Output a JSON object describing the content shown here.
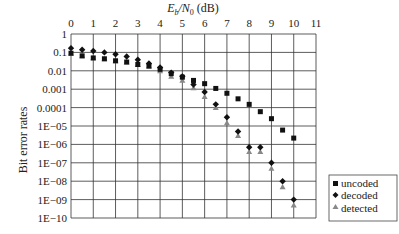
{
  "chart_data": {
    "type": "scatter",
    "title": "",
    "xlabel": "Eb/N0 (dB)",
    "ylabel": "Bit error rates",
    "x_scale": "linear",
    "y_scale": "log",
    "xlim": [
      0,
      11
    ],
    "ylim": [
      1e-10,
      1
    ],
    "xticks": [
      "0",
      "1",
      "2",
      "3",
      "4",
      "5",
      "6",
      "7",
      "8",
      "9",
      "10",
      "11"
    ],
    "yticks": [
      "1",
      "0.1",
      "0.01",
      "0.001",
      "0.0001",
      "1E−05",
      "1E−06",
      "1E−07",
      "1E−08",
      "1E−09",
      "1E−10"
    ],
    "grid": true,
    "legend_position": "right-bottom",
    "x": [
      0,
      0.5,
      1,
      1.5,
      2,
      2.5,
      3,
      3.5,
      4,
      4.5,
      5,
      5.5,
      6,
      6.5,
      7,
      7.5,
      8,
      8.5,
      9,
      9.5,
      10
    ],
    "series": [
      {
        "name": "uncoded",
        "marker": "square",
        "color": "#111111",
        "values": [
          0.09,
          0.065,
          0.05,
          0.045,
          0.035,
          0.03,
          0.022,
          0.018,
          0.012,
          0.007,
          0.0045,
          0.003,
          0.002,
          0.0011,
          0.0006,
          0.0003,
          0.00015,
          6e-05,
          2.5e-05,
          6e-06,
          2.2e-06
        ]
      },
      {
        "name": "decoded",
        "marker": "diamond",
        "color": "#111111",
        "values": [
          0.17,
          0.14,
          0.12,
          0.1,
          0.08,
          0.06,
          0.04,
          0.025,
          0.015,
          0.008,
          0.005,
          0.0018,
          0.0007,
          0.00015,
          3e-05,
          5e-06,
          7e-07,
          7e-07,
          1e-07,
          1e-08,
          1e-09
        ]
      },
      {
        "name": "detected",
        "marker": "triangle",
        "color": "#888888",
        "values": [
          0.09,
          0.065,
          0.05,
          0.045,
          0.035,
          0.03,
          0.022,
          0.018,
          0.01,
          0.005,
          0.003,
          0.0012,
          0.0004,
          0.0001,
          1.5e-05,
          3e-06,
          4e-07,
          4e-07,
          5e-08,
          5e-09,
          5e-10
        ]
      }
    ]
  },
  "labels": {
    "xlabel_italic": "E",
    "xlabel_sub_b": "b",
    "xlabel_slash": "/N",
    "xlabel_sub_0": "0",
    "xlabel_unit": " (dB)",
    "ylabel": "Bit error rates"
  },
  "legend": [
    {
      "label": "uncoded"
    },
    {
      "label": "decoded"
    },
    {
      "label": "detected"
    }
  ]
}
